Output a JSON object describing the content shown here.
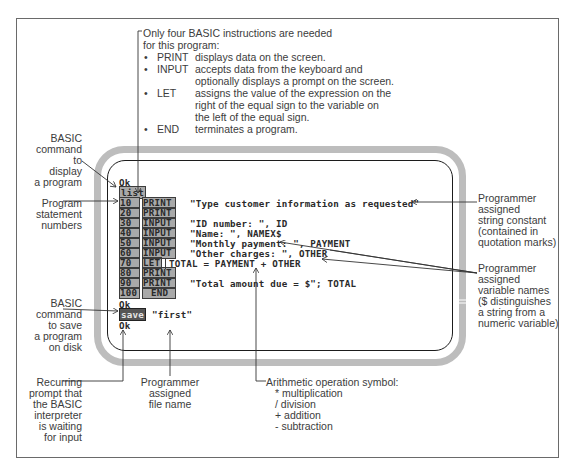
{
  "instructions_note": {
    "intro": [
      "Only four BASIC instructions are needed",
      "for this program:"
    ],
    "items": [
      {
        "keyword": "PRINT",
        "desc": [
          "displays data on the screen."
        ]
      },
      {
        "keyword": "INPUT",
        "desc": [
          "accepts data from the keyboard and",
          "optionally displays a prompt on the screen."
        ]
      },
      {
        "keyword": "LET",
        "desc": [
          "assigns the value of the expression on the",
          "right of the equal sign to the variable on",
          "the left of the equal sign."
        ]
      },
      {
        "keyword": "END",
        "desc": [
          "terminates a program."
        ]
      }
    ]
  },
  "left_labels": {
    "list_command": [
      "BASIC",
      "command",
      "to",
      "display",
      "a program"
    ],
    "statement_numbers": [
      "Program",
      "statement",
      "numbers"
    ],
    "save_command": [
      "BASIC",
      "command",
      "to save",
      "a program",
      "on disk"
    ],
    "recurring_prompt": [
      "Recurring",
      "prompt that",
      "the BASIC",
      "interpreter",
      "is waiting",
      "for input"
    ]
  },
  "bottom_labels": {
    "file_name": [
      "Programmer",
      "assigned",
      "file name"
    ],
    "arithmetic": {
      "title": "Arithmetic operation symbol:",
      "items": [
        "* multiplication",
        "/ division",
        "+ addition",
        "- subtraction"
      ]
    }
  },
  "right_labels": {
    "string_constant": [
      "Programmer",
      "assigned",
      "string constant",
      "(contained in",
      "quotation marks)"
    ],
    "variable_names": [
      "Programmer",
      "assigned",
      "variable names",
      "($ distinguishes",
      "a string from a",
      "numeric variable)"
    ]
  },
  "screen": {
    "ok_top": "Ok",
    "list_cmd": "list",
    "lines": [
      {
        "num": "10",
        "kw": "PRINT",
        "text": "\"Type customer information as requested\""
      },
      {
        "num": "20",
        "kw": "PRINT",
        "text": ""
      },
      {
        "num": "30",
        "kw": "INPUT",
        "text": "\"ID number: \", ID"
      },
      {
        "num": "40",
        "kw": "INPUT",
        "text": "\"Name: \", NAMEX$"
      },
      {
        "num": "50",
        "kw": "INPUT",
        "text": "\"Monthly payment: \", PAYMENT"
      },
      {
        "num": "60",
        "kw": "INPUT",
        "text": "\"Other charges: \", OTHER"
      },
      {
        "num": "70",
        "kw": "LET",
        "text": "TOTAL = PAYMENT + OTHER"
      },
      {
        "num": "80",
        "kw": "PRINT",
        "text": ""
      },
      {
        "num": "90",
        "kw": "PRINT",
        "text": "\"Total amount due = $\"; TOTAL"
      },
      {
        "num": "100",
        "kw": "END",
        "text": ""
      }
    ],
    "ok_mid": "Ok",
    "save_cmd": "save",
    "save_arg": "\"first\"",
    "ok_bottom": "Ok"
  }
}
